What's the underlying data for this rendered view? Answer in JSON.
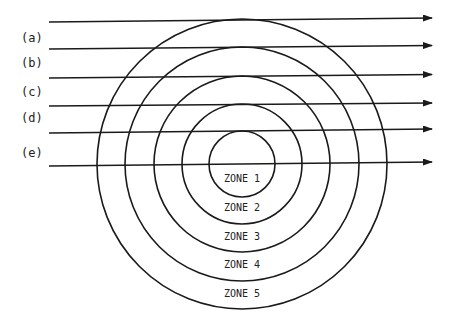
{
  "diagram": {
    "center": {
      "x": 242,
      "y": 164
    },
    "stroke_color": "#1a1a1a",
    "circles": [
      {
        "name": "zone-1-boundary",
        "r": 33
      },
      {
        "name": "zone-2-boundary",
        "r": 60
      },
      {
        "name": "zone-3-boundary",
        "r": 88
      },
      {
        "name": "zone-4-boundary",
        "r": 117
      },
      {
        "name": "zone-5-boundary",
        "r": 145
      }
    ],
    "zones": [
      {
        "label": "ZONE 1",
        "y": 182
      },
      {
        "label": "ZONE 2",
        "y": 211
      },
      {
        "label": "ZONE 3",
        "y": 240
      },
      {
        "label": "ZONE 4",
        "y": 268
      },
      {
        "label": "ZONE 5",
        "y": 297
      }
    ],
    "rays": [
      {
        "y1": 22,
        "y2": 18
      },
      {
        "y1": 49,
        "y2": 45.5
      },
      {
        "y1": 78,
        "y2": 74.5
      },
      {
        "y1": 106,
        "y2": 103
      },
      {
        "y1": 133,
        "y2": 129
      },
      {
        "y1": 166,
        "y2": 162
      }
    ],
    "ray_x_start": 49,
    "ray_x_end": 432,
    "ray_labels": [
      {
        "text": "(a)",
        "y": 42
      },
      {
        "text": "(b)",
        "y": 67
      },
      {
        "text": "(c)",
        "y": 96
      },
      {
        "text": "(d)",
        "y": 122
      },
      {
        "text": "(e)",
        "y": 157
      }
    ]
  }
}
